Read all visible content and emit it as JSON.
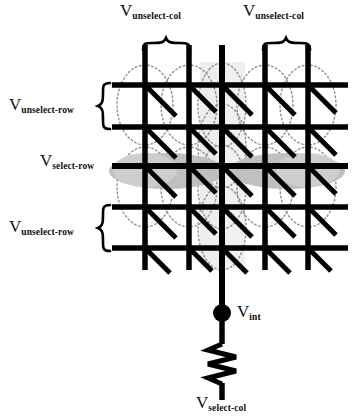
{
  "figure": {
    "type": "crossbar-memristor-array-schematic",
    "title": "",
    "background_color": "#ffffff",
    "line_color": "#000000",
    "dotted_ellipse_color": "#8c8c8c",
    "select_row_shade_color": "#b9b9b9",
    "select_col_shade_color": "#eeeeee"
  },
  "labels": {
    "unselect_col_left": {
      "v": "V",
      "sub": "unselect-col"
    },
    "unselect_col_right": {
      "v": "V",
      "sub": "unselect-col"
    },
    "unselect_row_top": {
      "v": "V",
      "sub": "unselect-row"
    },
    "select_row": {
      "v": "V",
      "sub": "select-row"
    },
    "unselect_row_bottom": {
      "v": "V",
      "sub": "unselect-row"
    },
    "v_int": {
      "v": "V",
      "sub": "int"
    },
    "select_col": {
      "v": "V",
      "sub": "select-col"
    }
  },
  "array": {
    "rows": 5,
    "columns": 5,
    "row_y": [
      85,
      127,
      166,
      207,
      248
    ],
    "column_x": [
      145,
      189,
      222,
      265,
      308
    ],
    "selected_row_index": 2,
    "selected_column_index": 2,
    "device_symbol": "diagonal-memristor",
    "node_dot": {
      "x": 222,
      "y": 313,
      "radius": 8
    },
    "resistor": {
      "x": 222,
      "y_top": 345,
      "y_bottom": 385,
      "zigzags": 5
    }
  },
  "braces": {
    "top_left": {
      "x1": 143,
      "x2": 191,
      "y": 42
    },
    "top_right": {
      "x1": 263,
      "x2": 311,
      "y": 42
    },
    "left_top": {
      "y1": 84,
      "y2": 128,
      "x": 104
    },
    "left_bottom": {
      "y1": 206,
      "y2": 250,
      "x": 104
    }
  }
}
